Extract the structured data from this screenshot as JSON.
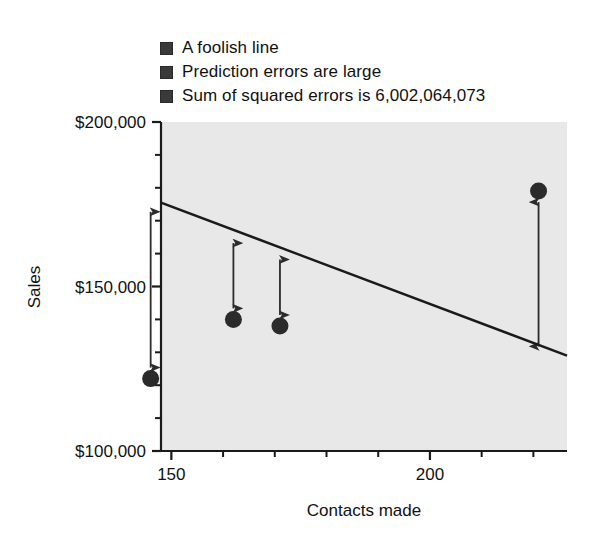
{
  "chart_data": {
    "type": "scatter",
    "title": "",
    "xlabel": "Contacts made",
    "ylabel": "Sales",
    "xlim": [
      148,
      226.5
    ],
    "ylim": [
      100000,
      200000
    ],
    "grid": false,
    "legend_position": "above-plot",
    "x_ticks_major": [
      150,
      200
    ],
    "x_tick_labels": [
      "150",
      "200"
    ],
    "x_ticks_minor": [
      160,
      170,
      180,
      190,
      210,
      220
    ],
    "y_ticks_major": [
      200000,
      150000,
      100000
    ],
    "y_tick_labels": [
      "$200,000",
      "$150,000",
      "$100,000"
    ],
    "y_ticks_minor": [
      190000,
      180000,
      170000,
      160000,
      140000,
      130000,
      120000,
      110000
    ],
    "points": [
      {
        "x": 146,
        "y": 122000
      },
      {
        "x": 162,
        "y": 140000
      },
      {
        "x": 171,
        "y": 138000
      },
      {
        "x": 221,
        "y": 179000
      }
    ],
    "fit_line": {
      "name": "A foolish line",
      "x_start": 148,
      "y_start": 175500,
      "x_end": 226.5,
      "y_end": 129000
    },
    "residual_arrows": [
      {
        "x": 146,
        "y_point": 122000,
        "y_line": 173000
      },
      {
        "x": 162,
        "y_point": 140000,
        "y_line": 163500
      },
      {
        "x": 171,
        "y_point": 138000,
        "y_line": 158500
      },
      {
        "x": 221,
        "y_point": 179000,
        "y_line": 131500
      }
    ],
    "sum_of_squared_errors": "6,002,064,073",
    "colors": {
      "plot_background": "#e8e8e8",
      "marker": "#2b2b2b",
      "line": "#1a1a1a",
      "arrow": "#2b2b2b",
      "axis": "#1a1a1a"
    }
  },
  "legend": {
    "items": [
      {
        "label": "A foolish line"
      },
      {
        "label": "Prediction errors are large"
      },
      {
        "label": "Sum of squared errors is 6,002,064,073"
      }
    ]
  },
  "axes": {
    "y_title": "Sales",
    "x_title": "Contacts made",
    "y_labels": [
      "$200,000",
      "$150,000",
      "$100,000"
    ],
    "x_labels": [
      "150",
      "200"
    ]
  }
}
